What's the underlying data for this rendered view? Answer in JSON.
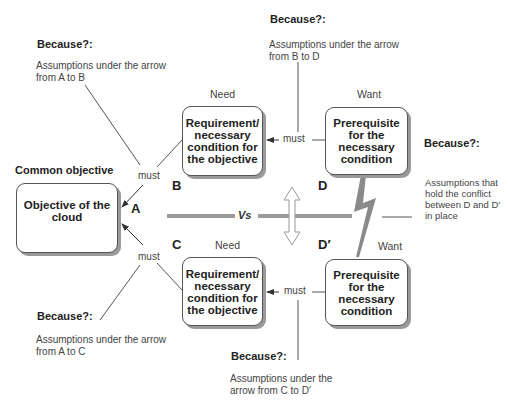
{
  "common_objective_label": "Common objective",
  "nodes": {
    "A": {
      "letter": "A",
      "text": "Objective of the cloud"
    },
    "B": {
      "letter": "B",
      "header": "Need",
      "text": "Requirement/ necessary condition for the objective"
    },
    "C": {
      "letter": "C",
      "header": "Need",
      "text": "Requirement/ necessary condition for the objective"
    },
    "D": {
      "letter": "D",
      "header": "Want",
      "text": "Prerequisite for the necessary condition"
    },
    "Dp": {
      "letter": "D′",
      "header": "Want",
      "text": "Prerequisite for the necessary condition"
    }
  },
  "connectors": {
    "must_ab": "must",
    "must_ac": "must",
    "must_bd": "must",
    "must_cd": "must",
    "vs": "Vs"
  },
  "assumptions": {
    "ab": {
      "title": "Because?:",
      "text_line1": "Assumptions under the arrow",
      "text_line2": "from A to B"
    },
    "bd": {
      "title": "Because?:",
      "text_line1": "Assumptions under the arrow",
      "text_line2": "from B to D"
    },
    "ac": {
      "title": "Because?:",
      "text_line1": "Assumptions under the arrow",
      "text_line2": "from A to C"
    },
    "cd": {
      "title": "Because?:",
      "text_line1": "Assumptions under the",
      "text_line2": "arrow from C to D′"
    },
    "dd": {
      "title": "Because?:",
      "text_line1": "Assumptions that",
      "text_line2": "hold the conflict",
      "text_line3": "between D and D′",
      "text_line4": "in place"
    }
  },
  "colors": {
    "line": "#555555",
    "thick_line": "#9a9a9a",
    "shadow": "#9a9a9a",
    "text": "#222222"
  }
}
